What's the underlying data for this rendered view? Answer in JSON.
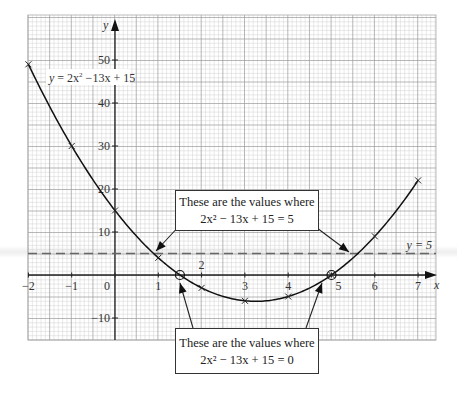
{
  "chart_data": {
    "type": "line",
    "title": "",
    "xlabel": "x",
    "ylabel": "y",
    "xlim": [
      -2,
      7.4
    ],
    "ylim": [
      -15,
      60
    ],
    "grid": true,
    "x_ticks": [
      -2,
      -1,
      0,
      1,
      2,
      3,
      4,
      5,
      6,
      7
    ],
    "y_ticks": [
      -10,
      10,
      20,
      30,
      40,
      50
    ],
    "x_tick_labels": [
      "−2",
      "−1",
      "0",
      "1",
      "2",
      "3",
      "4",
      "5",
      "6",
      "7"
    ],
    "y_tick_labels": [
      "−10",
      "10",
      "20",
      "30",
      "40",
      "50"
    ],
    "series": [
      {
        "name": "y = 2x² − 13x + 15",
        "style": "solid curve with cross markers",
        "x": [
          -2,
          -1,
          0,
          1,
          2,
          3,
          4,
          5,
          6,
          7
        ],
        "y": [
          49,
          30,
          15,
          4,
          -3,
          -6,
          -5,
          0,
          9,
          22
        ]
      },
      {
        "name": "y = 5",
        "style": "dashed horizontal line",
        "x": [
          -2,
          7.4
        ],
        "y": [
          5,
          5
        ]
      }
    ],
    "highlighted_points": [
      {
        "x": 1.5,
        "y": 0,
        "marker": "circle"
      },
      {
        "x": 5,
        "y": 0,
        "marker": "circle"
      }
    ],
    "intersections_y5": [
      0.9,
      5.6
    ],
    "annotations": [
      {
        "lines": [
          "These are the values where",
          "2x² − 13x + 15 = 5"
        ],
        "points_to": [
          0.9,
          5.6
        ]
      },
      {
        "lines": [
          "These are the values where",
          "2x² − 13x + 15 = 0"
        ],
        "points_to": [
          1.5,
          5
        ]
      }
    ]
  },
  "labels": {
    "curve_label_prefix": "y",
    "curve_label_rest": " = 2x",
    "curve_label_sup": "2",
    "curve_label_tail": " −13x + 15",
    "line_label": "y = 5",
    "x_axis": "x",
    "y_axis": "y"
  },
  "callouts": {
    "top": {
      "line1": "These are the values where",
      "line2": "2x² − 13x + 15 = 5"
    },
    "bottom": {
      "line1": "These are the values where",
      "line2": "2x² − 13x + 15 = 0"
    }
  }
}
